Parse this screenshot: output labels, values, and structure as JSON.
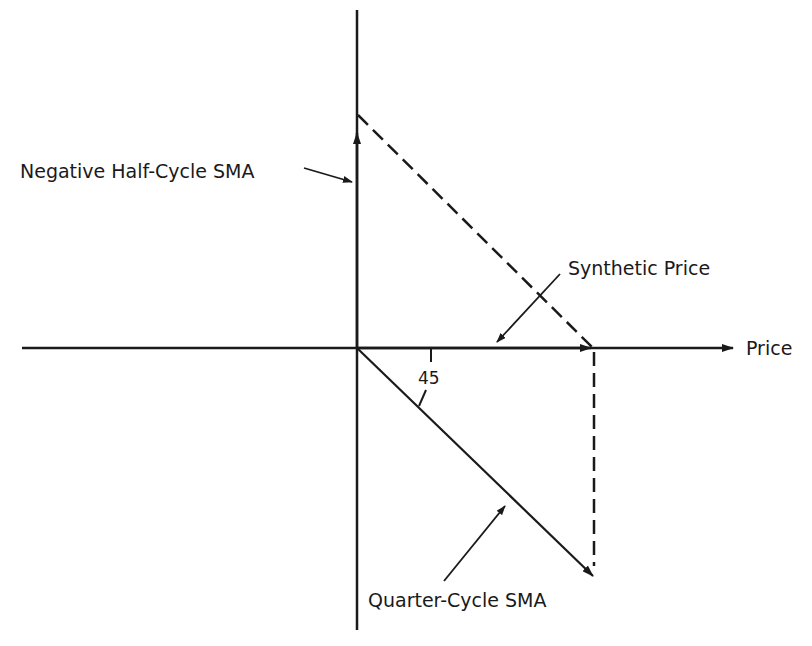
{
  "diagram": {
    "type": "vector-diagram",
    "colors": {
      "ink": "#1a1a1a",
      "background": "#ffffff"
    },
    "labels": {
      "negative_half_cycle": "Negative Half-Cycle SMA",
      "synthetic_price": "Synthetic Price",
      "price_axis": "Price",
      "quarter_cycle": "Quarter-Cycle SMA",
      "angle": "45"
    },
    "elements": [
      {
        "id": "price-axis",
        "kind": "axis",
        "direction": "horizontal",
        "label": "Price"
      },
      {
        "id": "vertical-axis",
        "kind": "axis",
        "direction": "vertical"
      },
      {
        "id": "negative-half-cycle-vector",
        "kind": "vector",
        "direction": "up",
        "label": "Negative Half-Cycle SMA"
      },
      {
        "id": "quarter-cycle-vector",
        "kind": "vector",
        "direction": "down-right",
        "angle_deg": 45,
        "label": "Quarter-Cycle SMA"
      },
      {
        "id": "synthetic-price-vector",
        "kind": "vector",
        "direction": "right",
        "label": "Synthetic Price"
      },
      {
        "id": "dashed-resultant",
        "kind": "dashed-line",
        "from": "negative-half-cycle-tip",
        "to": "synthetic-price-tip"
      },
      {
        "id": "dashed-projection",
        "kind": "dashed-line",
        "from": "synthetic-price-tip",
        "to": "quarter-cycle-tip"
      }
    ]
  }
}
